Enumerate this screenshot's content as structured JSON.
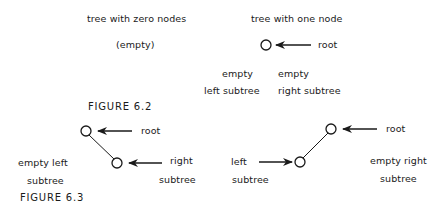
{
  "figure_6_2": {
    "caption": "FIGURE 6.2",
    "zero_tree": {
      "title": "tree with zero nodes",
      "content": "(empty)"
    },
    "one_tree": {
      "title": "tree with one node",
      "root_label": "root",
      "left_label_line1": "empty",
      "left_label_line2": "left subtree",
      "right_label_line1": "empty",
      "right_label_line2": "right subtree"
    }
  },
  "figure_6_3": {
    "caption": "FIGURE 6.3",
    "right_child_tree": {
      "root_label": "root",
      "child_label_line1": "right",
      "child_label_line2": "subtree",
      "empty_label_line1": "empty left",
      "empty_label_line2": "subtree"
    },
    "left_child_tree": {
      "root_label": "root",
      "child_label_line1": "left",
      "child_label_line2": "subtree",
      "empty_label_line1": "empty right",
      "empty_label_line2": "subtree"
    }
  }
}
